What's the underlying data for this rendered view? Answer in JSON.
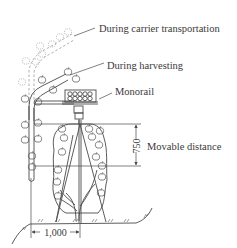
{
  "figure": {
    "type": "technical-diagram",
    "labels": {
      "carrier_transport": "During carrier transportation",
      "harvesting": "During harvesting",
      "monorail": "Monorail",
      "movable_distance": "Movable distance"
    },
    "dimensions": {
      "vertical": "750",
      "horizontal": "1,000"
    },
    "colors": {
      "line": "#4a4a4a",
      "dashed": "#8a8a8a",
      "text": "#3a3a3a",
      "background": "#ffffff"
    }
  }
}
